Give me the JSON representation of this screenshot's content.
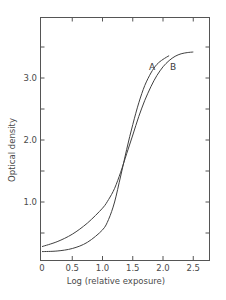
{
  "chart_data": {
    "type": "line",
    "title": "",
    "xlabel": "Log (relative exposure)",
    "ylabel": "Optical density",
    "xlim": [
      0,
      2.8
    ],
    "ylim": [
      0,
      4.0
    ],
    "grid": false,
    "legend": "inline labels near curve ends",
    "x_ticks": [
      0,
      0.5,
      1.0,
      1.5,
      2.0,
      2.5
    ],
    "x_tick_labels": [
      "0",
      "0.5",
      "1.0",
      "1.5",
      "2.0",
      "2.5"
    ],
    "y_ticks": [
      0.5,
      1.0,
      1.5,
      2.0,
      2.5,
      3.0,
      3.5
    ],
    "y_tick_labels": [
      "",
      "1.0",
      "",
      "2.0",
      "",
      "3.0",
      ""
    ],
    "annotations": [
      {
        "text": "A",
        "x": 1.88,
        "y": 3.3
      },
      {
        "text": "B",
        "x": 2.08,
        "y": 3.3
      }
    ],
    "series": [
      {
        "name": "A",
        "x": [
          0,
          0.25,
          0.5,
          0.75,
          1.0,
          1.1,
          1.2,
          1.3,
          1.4,
          1.5,
          1.6,
          1.7,
          1.8,
          1.9,
          2.0,
          2.1
        ],
        "values": [
          0.2,
          0.21,
          0.25,
          0.35,
          0.55,
          0.72,
          1.0,
          1.42,
          1.85,
          2.25,
          2.6,
          2.88,
          3.08,
          3.22,
          3.3,
          3.36
        ]
      },
      {
        "name": "B",
        "x": [
          0,
          0.25,
          0.5,
          0.75,
          1.0,
          1.1,
          1.2,
          1.3,
          1.4,
          1.5,
          1.6,
          1.7,
          1.8,
          1.9,
          2.0,
          2.1,
          2.2,
          2.3,
          2.4,
          2.5
        ],
        "values": [
          0.28,
          0.36,
          0.48,
          0.66,
          0.9,
          1.04,
          1.22,
          1.48,
          1.78,
          2.08,
          2.38,
          2.64,
          2.86,
          3.04,
          3.18,
          3.28,
          3.35,
          3.39,
          3.41,
          3.42
        ]
      }
    ]
  },
  "labels": {
    "xlabel": "Log (relative exposure)",
    "ylabel": "Optical density",
    "curve_a": "A",
    "curve_b": "B",
    "x_ticks": [
      "0",
      "0.5",
      "1.0",
      "1.5",
      "2.0",
      "2.5"
    ],
    "y_ticks": [
      "1.0",
      "2.0",
      "3.0"
    ]
  }
}
